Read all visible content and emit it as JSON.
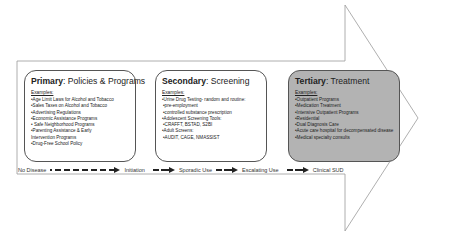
{
  "diagram": {
    "arrow": {
      "fill": "#ffffff",
      "stroke": "#9a9a9a"
    },
    "boxes": [
      {
        "id": "primary",
        "title_bold": "Primary",
        "title_rest": ": Policies & Programs",
        "examples_label": "Examples:",
        "items": [
          "•Age Limit Laws for Alcohol and Tobacco",
          "•Sales Taxes on Alcohol and Tobacco",
          "•Advertising Regulations",
          "•Economic Assistance Programs",
          "• Safe Neighborhood Programs",
          "•Parenting Assistance & Early Intervention Programs",
          "•Drug-Free School Policy"
        ],
        "fill": "#ffffff"
      },
      {
        "id": "secondary",
        "title_bold": "Secondary",
        "title_rest": ": Screening",
        "examples_label": "Examples:",
        "items": [
          "•Urine Drug Testing- random and routine:",
          "•pre-employment",
          "•controlled substance prescription",
          "•Adolescent Screening Tools:",
          "•CRAFFT, BSTAD, S2BI",
          "•Adult Screens:",
          "•AUDIT, CAGE, NMASSIST"
        ],
        "fill": "#ffffff"
      },
      {
        "id": "tertiary",
        "title_bold": "Tertiary",
        "title_rest": ": Treatment",
        "examples_label": "Examples:",
        "items": [
          "•Outpatient Programs",
          "•Medication Treatment",
          "•Intensive Outpatient Programs",
          "•Residential",
          "•Dual Diagnosis Care",
          "•Acute care hospital for decompensated disease",
          "•Medical specialty consults"
        ],
        "fill": "#b3b3b3"
      }
    ],
    "stages": [
      "No Disease",
      "Initiation",
      "Sporadic Use",
      "Escalating Use",
      "Clinical SUD"
    ]
  }
}
